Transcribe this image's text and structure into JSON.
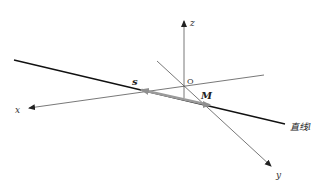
{
  "diagram": {
    "type": "3d-coordinate-line-diagram",
    "axes": {
      "x_label": "x",
      "y_label": "y",
      "z_label": "z",
      "origin_label": "O"
    },
    "line": {
      "label_prefix": "直线",
      "label_var": "l"
    },
    "vector": {
      "label": "s",
      "color": "#9a9a9a"
    },
    "point": {
      "label": "M"
    },
    "colors": {
      "axis": "#444444",
      "line": "#111111",
      "vector": "#9a9a9a",
      "background": "#ffffff"
    }
  }
}
